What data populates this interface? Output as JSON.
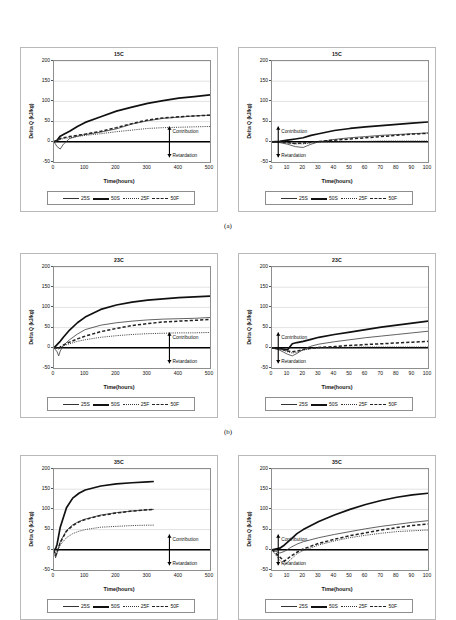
{
  "figure": {
    "subcaptions": [
      "(a)",
      "(b)",
      "(c)"
    ]
  },
  "axis": {
    "ylabel": "Delta Q  (kJ/kg)",
    "xlabel": "Time(hours)",
    "yticks": [
      "200",
      "150",
      "100",
      "50",
      "0",
      "-50"
    ],
    "xticks_500": [
      "0",
      "100",
      "200",
      "300",
      "400",
      "500"
    ],
    "xticks_100": [
      "0",
      "10",
      "20",
      "30",
      "40",
      "50",
      "60",
      "70",
      "80",
      "90",
      "100"
    ]
  },
  "annotations": {
    "contribution": "Contribution",
    "retardation": "Retardation"
  },
  "legend": {
    "items": [
      {
        "label": "25S",
        "style": "thin-solid"
      },
      {
        "label": "50S",
        "style": "thick-solid"
      },
      {
        "label": "25F",
        "style": "dotted"
      },
      {
        "label": "50F",
        "style": "dashed"
      }
    ]
  },
  "chart_data": [
    {
      "id": "a-left",
      "type": "line",
      "title": "15C",
      "xlabel": "Time(hours)",
      "ylabel": "Delta Q  (kJ/kg)",
      "xlim": [
        0,
        500
      ],
      "ylim": [
        -50,
        200
      ],
      "grid": true,
      "legend_position": "below",
      "annotations": [
        "Contribution",
        "Retardation"
      ],
      "x": [
        0,
        10,
        20,
        30,
        50,
        75,
        100,
        150,
        200,
        250,
        300,
        350,
        400,
        450,
        500
      ],
      "series": [
        {
          "name": "25S",
          "style": "thin-solid",
          "values": [
            0,
            -12,
            -18,
            -6,
            8,
            14,
            18,
            24,
            32,
            44,
            52,
            58,
            61,
            64,
            66
          ]
        },
        {
          "name": "50S",
          "style": "thick-solid",
          "values": [
            0,
            4,
            14,
            18,
            26,
            38,
            48,
            62,
            76,
            86,
            95,
            102,
            108,
            112,
            116
          ]
        },
        {
          "name": "25F",
          "style": "dotted",
          "values": [
            0,
            2,
            6,
            8,
            10,
            13,
            16,
            20,
            25,
            29,
            33,
            35,
            36,
            37,
            38
          ]
        },
        {
          "name": "50F",
          "style": "dashed",
          "values": [
            0,
            3,
            8,
            10,
            13,
            16,
            19,
            26,
            35,
            45,
            54,
            59,
            62,
            64,
            66
          ]
        }
      ]
    },
    {
      "id": "a-right",
      "type": "line",
      "title": "15C",
      "xlabel": "Time(hours)",
      "ylabel": "Delta Q  (kJ/kg)",
      "xlim": [
        0,
        100
      ],
      "ylim": [
        -50,
        200
      ],
      "grid": true,
      "legend_position": "below",
      "annotations": [
        "Contribution",
        "Retardation"
      ],
      "x": [
        0,
        5,
        10,
        15,
        20,
        25,
        30,
        40,
        50,
        60,
        70,
        80,
        90,
        100
      ],
      "series": [
        {
          "name": "25S",
          "style": "thin-solid",
          "values": [
            0,
            -2,
            -6,
            -12,
            -14,
            -6,
            0,
            6,
            10,
            13,
            16,
            18,
            20,
            22
          ]
        },
        {
          "name": "50S",
          "style": "thick-solid",
          "values": [
            0,
            1,
            4,
            7,
            10,
            16,
            20,
            28,
            33,
            37,
            40,
            43,
            46,
            49
          ]
        },
        {
          "name": "25F",
          "style": "dotted",
          "values": [
            0,
            -1,
            -3,
            -5,
            -5,
            -3,
            -1,
            0,
            1,
            1,
            2,
            2,
            2,
            2
          ]
        },
        {
          "name": "50F",
          "style": "dashed",
          "values": [
            0,
            0,
            -2,
            -4,
            -3,
            -1,
            1,
            4,
            7,
            10,
            13,
            16,
            19,
            21
          ]
        }
      ]
    },
    {
      "id": "b-left",
      "type": "line",
      "title": "23C",
      "xlabel": "Time(hours)",
      "ylabel": "Delta Q  (kJ/kg)",
      "xlim": [
        0,
        500
      ],
      "ylim": [
        -50,
        200
      ],
      "grid": true,
      "legend_position": "below",
      "annotations": [
        "Contribution",
        "Retardation"
      ],
      "x": [
        0,
        10,
        15,
        20,
        30,
        50,
        75,
        100,
        150,
        200,
        250,
        300,
        350,
        400,
        450,
        500
      ],
      "series": [
        {
          "name": "25S",
          "style": "thin-solid",
          "values": [
            0,
            -10,
            -20,
            -8,
            6,
            20,
            34,
            45,
            56,
            62,
            66,
            69,
            71,
            72,
            73,
            75
          ]
        },
        {
          "name": "50S",
          "style": "thick-solid",
          "values": [
            0,
            8,
            12,
            16,
            26,
            44,
            62,
            76,
            95,
            106,
            113,
            118,
            121,
            124,
            126,
            128
          ]
        },
        {
          "name": "25F",
          "style": "dotted",
          "values": [
            0,
            -1,
            -3,
            0,
            5,
            10,
            16,
            20,
            26,
            30,
            33,
            35,
            36,
            37,
            37,
            38
          ]
        },
        {
          "name": "50F",
          "style": "dashed",
          "values": [
            0,
            0,
            -2,
            2,
            7,
            14,
            22,
            29,
            40,
            48,
            55,
            60,
            64,
            66,
            68,
            70
          ]
        }
      ]
    },
    {
      "id": "b-right",
      "type": "line",
      "title": "23C",
      "xlabel": "Time(hours)",
      "ylabel": "Delta Q  (kJ/kg)",
      "xlim": [
        0,
        100
      ],
      "ylim": [
        -50,
        200
      ],
      "grid": true,
      "legend_position": "below",
      "annotations": [
        "Contribution",
        "Retardation"
      ],
      "x": [
        0,
        5,
        10,
        13,
        16,
        20,
        25,
        30,
        40,
        50,
        60,
        70,
        80,
        90,
        100
      ],
      "series": [
        {
          "name": "25S",
          "style": "thin-solid",
          "values": [
            0,
            -6,
            -16,
            -20,
            -14,
            -4,
            4,
            9,
            15,
            20,
            25,
            29,
            33,
            37,
            41
          ]
        },
        {
          "name": "50S",
          "style": "thick-solid",
          "values": [
            0,
            -2,
            -5,
            10,
            13,
            16,
            21,
            26,
            33,
            39,
            45,
            51,
            56,
            61,
            66
          ]
        },
        {
          "name": "25F",
          "style": "dotted",
          "values": [
            0,
            -3,
            -10,
            -13,
            -11,
            -6,
            -2,
            0,
            1,
            1,
            2,
            2,
            2,
            2,
            2
          ]
        },
        {
          "name": "50F",
          "style": "dashed",
          "values": [
            0,
            -2,
            -8,
            -10,
            -8,
            -4,
            -1,
            1,
            3,
            6,
            8,
            10,
            12,
            14,
            16
          ]
        }
      ]
    },
    {
      "id": "c-left",
      "type": "line",
      "title": "35C",
      "xlabel": "Time(hours)",
      "ylabel": "Delta Q  (kJ/kg)",
      "xlim": [
        0,
        500
      ],
      "ylim": [
        -50,
        200
      ],
      "grid": true,
      "legend_position": "below",
      "annotations": [
        "Contribution",
        "Retardation"
      ],
      "x": [
        0,
        5,
        10,
        20,
        40,
        60,
        80,
        100,
        150,
        200,
        250,
        300,
        320
      ],
      "series": [
        {
          "name": "25S",
          "style": "thin-solid",
          "values": [
            0,
            -20,
            -8,
            20,
            48,
            62,
            70,
            76,
            86,
            92,
            96,
            99,
            100
          ]
        },
        {
          "name": "50S",
          "style": "thick-solid",
          "values": [
            0,
            2,
            14,
            56,
            104,
            128,
            140,
            148,
            158,
            163,
            166,
            168,
            169
          ]
        },
        {
          "name": "25F",
          "style": "dotted",
          "values": [
            0,
            -10,
            -4,
            12,
            30,
            40,
            46,
            50,
            56,
            58,
            60,
            61,
            61
          ]
        },
        {
          "name": "50F",
          "style": "dashed",
          "values": [
            0,
            -14,
            -6,
            18,
            46,
            60,
            69,
            75,
            85,
            91,
            96,
            99,
            100
          ]
        }
      ]
    },
    {
      "id": "c-right",
      "type": "line",
      "title": "35C",
      "xlabel": "Time(hours)",
      "ylabel": "Delta Q  (kJ/kg)",
      "xlim": [
        0,
        100
      ],
      "ylim": [
        -50,
        200
      ],
      "grid": true,
      "legend_position": "below",
      "annotations": [
        "Contribution",
        "Retardation"
      ],
      "x": [
        0,
        5,
        8,
        12,
        16,
        20,
        30,
        40,
        50,
        60,
        70,
        80,
        90,
        100
      ],
      "series": [
        {
          "name": "25S",
          "style": "thin-solid",
          "values": [
            0,
            -8,
            -4,
            6,
            14,
            20,
            30,
            38,
            45,
            52,
            58,
            63,
            68,
            72
          ]
        },
        {
          "name": "50S",
          "style": "thick-solid",
          "values": [
            0,
            4,
            12,
            26,
            40,
            50,
            70,
            86,
            100,
            112,
            122,
            130,
            136,
            140
          ]
        },
        {
          "name": "25F",
          "style": "dotted",
          "values": [
            0,
            -26,
            -38,
            -24,
            -10,
            -2,
            12,
            22,
            30,
            36,
            41,
            45,
            47,
            49
          ]
        },
        {
          "name": "50F",
          "style": "dashed",
          "values": [
            0,
            -18,
            -28,
            -16,
            -6,
            2,
            16,
            26,
            35,
            42,
            49,
            55,
            60,
            64
          ]
        }
      ]
    }
  ]
}
